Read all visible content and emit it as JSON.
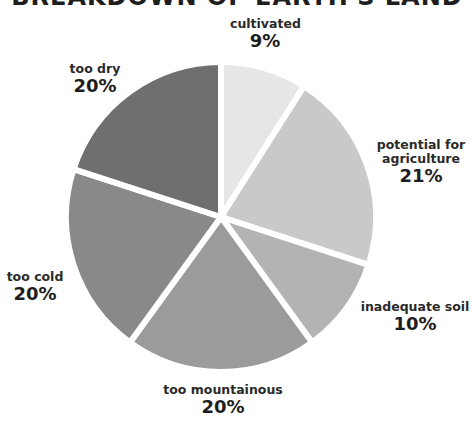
{
  "chart_data": {
    "type": "pie",
    "title": "BREAKDOWN OF EARTH'S LAND",
    "categories": [
      "cultivated",
      "potential for agriculture",
      "inadequate soil",
      "too mountainous",
      "too cold",
      "too dry"
    ],
    "values": [
      9,
      21,
      10,
      20,
      20,
      20
    ],
    "value_labels": [
      "9%",
      "21%",
      "10%",
      "20%",
      "20%",
      "20%"
    ],
    "colors": [
      "#e6e6e6",
      "#c9c9c9",
      "#b3b3b3",
      "#9b9b9b",
      "#898989",
      "#6f6f6f"
    ],
    "start_angle": "12 o'clock",
    "direction": "clockwise",
    "legend": "none (direct labels)",
    "xlabel": "",
    "ylabel": ""
  },
  "labels": {
    "cultivated": {
      "name": "cultivated",
      "pct": "9%"
    },
    "potential": {
      "name_line1": "potential for",
      "name_line2": "agriculture",
      "pct": "21%"
    },
    "inadequate": {
      "name": "inadequate soil",
      "pct": "10%"
    },
    "mountainous": {
      "name": "too mountainous",
      "pct": "20%"
    },
    "cold": {
      "name": "too cold",
      "pct": "20%"
    },
    "dry": {
      "name": "too dry",
      "pct": "20%"
    }
  }
}
